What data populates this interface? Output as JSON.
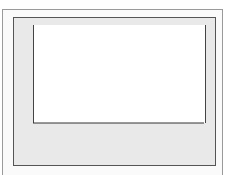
{
  "caption": "Comparison of normal and Student's t",
  "chart_data": {
    "type": "line",
    "xlabel": "n = 9",
    "ylabel": "",
    "x_ticks": [
      -4,
      -3,
      -2,
      -1,
      0,
      1,
      2,
      3,
      4
    ],
    "xlim": [
      -4,
      4
    ],
    "grid": false,
    "legend": null,
    "series": [
      {
        "name": "Standard normal",
        "function": "normal pdf",
        "peak": 0.399
      },
      {
        "name": "Student's t (df = 8)",
        "function": "t pdf",
        "peak": 0.387
      }
    ],
    "annotations": [
      "n = 9"
    ]
  },
  "axis": {
    "ticks": [
      "−4",
      "−3",
      "−2",
      "−1",
      "0",
      "1",
      "2",
      "3",
      "4"
    ],
    "n_label_var": "n",
    "n_label_rest": " = 9"
  }
}
